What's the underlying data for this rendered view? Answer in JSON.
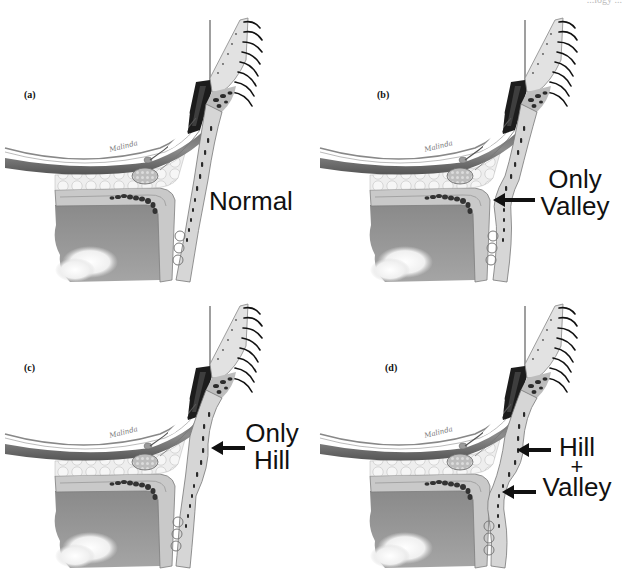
{
  "header": {
    "journal_fragment": "...logy ..."
  },
  "figure": {
    "panels": [
      {
        "id": "a",
        "label": "(a)",
        "variant": "normal",
        "caption_lines": [
          "Normal"
        ],
        "arrows": 0
      },
      {
        "id": "b",
        "label": "(b)",
        "variant": "valley",
        "caption_lines": [
          "Only",
          "Valley"
        ],
        "arrows": 1
      },
      {
        "id": "c",
        "label": "(c)",
        "variant": "hill",
        "caption_lines": [
          "Only",
          "Hill"
        ],
        "arrows": 1
      },
      {
        "id": "d",
        "label": "(d)",
        "variant": "hill_valley",
        "caption_lines": [
          "Hill",
          "+",
          "Valley"
        ],
        "arrows": 2
      }
    ],
    "artist_signature": "Malinda",
    "colors": {
      "background": "#ffffff",
      "skin": "#d9d9d9",
      "fat": "#ececec",
      "muscle": "#7a7a7a",
      "bone": "#9a9a9a",
      "maxillary_sinus": "#8f8f8f",
      "tarsus": "#1a1a1a",
      "text": "#111111"
    }
  }
}
